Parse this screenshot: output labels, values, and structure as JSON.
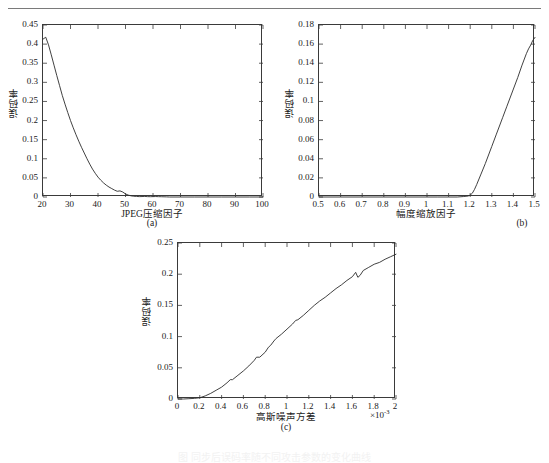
{
  "page": {
    "rule_color": "#7a7a7a",
    "line_color": "#2b2b2b",
    "axis_color": "#3a3a3a"
  },
  "figure": {
    "subcaption_a": "(a)",
    "subcaption_b": "(b)",
    "subcaption_c": "(c)",
    "ghost_caption": "图      同步后误码率随不同攻击参数的变化曲线"
  },
  "chart_data": [
    {
      "id": "a",
      "type": "line",
      "title": "",
      "subcaption": "(a)",
      "xlabel": "JPEG压缩因子",
      "ylabel": "误码率",
      "xlim": [
        20,
        100
      ],
      "ylim": [
        0,
        0.45
      ],
      "xticks": [
        20,
        30,
        40,
        50,
        60,
        70,
        80,
        90,
        100
      ],
      "xticklabels": [
        "20",
        "30",
        "40",
        "50",
        "60",
        "70",
        "80",
        "90",
        "100"
      ],
      "yticks": [
        0,
        0.05,
        0.1,
        0.15,
        0.2,
        0.25,
        0.3,
        0.35,
        0.4,
        0.45
      ],
      "yticklabels": [
        "0",
        "0.05",
        "0.1",
        "0.15",
        "0.2",
        "0.25",
        "0.3",
        "0.35",
        "0.4",
        "0.45"
      ],
      "grid": false,
      "legend": "none",
      "x": [
        20,
        21,
        22,
        23,
        24,
        25,
        26,
        27,
        28,
        29,
        30,
        31,
        32,
        33,
        34,
        35,
        36,
        37,
        38,
        39,
        40,
        41,
        42,
        43,
        44,
        45,
        46,
        47,
        48,
        49,
        50,
        51,
        52,
        53,
        54,
        55,
        56,
        57,
        58,
        59,
        60,
        61,
        62,
        63,
        64,
        65,
        66,
        70,
        75,
        80,
        85,
        90,
        95,
        100
      ],
      "y": [
        0.413,
        0.418,
        0.398,
        0.372,
        0.345,
        0.318,
        0.292,
        0.266,
        0.243,
        0.221,
        0.2,
        0.181,
        0.163,
        0.146,
        0.13,
        0.115,
        0.1,
        0.086,
        0.073,
        0.062,
        0.052,
        0.044,
        0.037,
        0.031,
        0.026,
        0.022,
        0.018,
        0.015,
        0.016,
        0.013,
        0.008,
        0.005,
        0.003,
        0.002,
        0.0015,
        0.001,
        0.0012,
        0.0015,
        0.001,
        0.0008,
        0.001,
        0.0012,
        0.0009,
        0.0007,
        0.0005,
        0.0003,
        0.0,
        0.0,
        0.0,
        0.0,
        0.0,
        0.0,
        0.0,
        0.0
      ]
    },
    {
      "id": "b",
      "type": "line",
      "title": "",
      "subcaption": "(b)",
      "xlabel": "幅度缩放因子",
      "ylabel": "误码率",
      "xlim": [
        0.5,
        1.5
      ],
      "ylim": [
        0,
        0.18
      ],
      "xticks": [
        0.5,
        0.6,
        0.7,
        0.8,
        0.9,
        1.0,
        1.1,
        1.2,
        1.3,
        1.4,
        1.5
      ],
      "xticklabels": [
        "0.5",
        "0.6",
        "0.7",
        "0.8",
        "0.9",
        "1",
        "1.1",
        "1.2",
        "1.3",
        "1.4",
        "1.5"
      ],
      "yticks": [
        0,
        0.02,
        0.04,
        0.06,
        0.08,
        0.1,
        0.12,
        0.14,
        0.16,
        0.18
      ],
      "yticklabels": [
        "0",
        "0.02",
        "0.04",
        "0.06",
        "0.08",
        "0.1",
        "0.12",
        "0.14",
        "0.16",
        "0.18"
      ],
      "grid": false,
      "legend": "none",
      "x": [
        0.5,
        0.6,
        0.7,
        0.8,
        0.9,
        1.0,
        1.05,
        1.1,
        1.14,
        1.17,
        1.19,
        1.2,
        1.21,
        1.22,
        1.23,
        1.25,
        1.27,
        1.3,
        1.32,
        1.35,
        1.37,
        1.4,
        1.42,
        1.44,
        1.46,
        1.47,
        1.48,
        1.49,
        1.5
      ],
      "y": [
        0.0,
        0.0,
        0.0,
        0.0,
        0.0,
        0.0,
        0.0,
        0.0,
        0.0,
        0.0005,
        0.001,
        0.002,
        0.004,
        0.008,
        0.013,
        0.024,
        0.035,
        0.053,
        0.065,
        0.083,
        0.095,
        0.113,
        0.125,
        0.138,
        0.15,
        0.155,
        0.159,
        0.164,
        0.167
      ]
    },
    {
      "id": "c",
      "type": "line",
      "title": "",
      "subcaption": "(c)",
      "xlabel": "高斯噪声方差",
      "ylabel": "误码率",
      "x_exponent": "×10",
      "x_exponent_power": "-3",
      "xlim": [
        0,
        2
      ],
      "ylim": [
        0,
        0.25
      ],
      "xticks": [
        0,
        0.2,
        0.4,
        0.6,
        0.8,
        1.0,
        1.2,
        1.4,
        1.6,
        1.8,
        2.0
      ],
      "xticklabels": [
        "0",
        "0.2",
        "0.4",
        "0.6",
        "0.8",
        "1",
        "1.2",
        "1.4",
        "1.6",
        "1.8",
        "2"
      ],
      "yticks": [
        0,
        0.05,
        0.1,
        0.15,
        0.2,
        0.25
      ],
      "yticklabels": [
        "0",
        "0.05",
        "0.1",
        "0.15",
        "0.2",
        "0.25"
      ],
      "grid": false,
      "legend": "none",
      "x": [
        0.0,
        0.05,
        0.1,
        0.15,
        0.2,
        0.25,
        0.3,
        0.35,
        0.4,
        0.45,
        0.48,
        0.5,
        0.55,
        0.6,
        0.65,
        0.7,
        0.72,
        0.75,
        0.8,
        0.83,
        0.85,
        0.88,
        0.9,
        0.95,
        1.0,
        1.05,
        1.08,
        1.1,
        1.15,
        1.2,
        1.25,
        1.3,
        1.35,
        1.4,
        1.45,
        1.5,
        1.55,
        1.6,
        1.63,
        1.65,
        1.67,
        1.7,
        1.75,
        1.8,
        1.85,
        1.9,
        1.95,
        2.0
      ],
      "y": [
        0.0,
        0.0,
        0.0005,
        0.001,
        0.002,
        0.005,
        0.009,
        0.014,
        0.019,
        0.026,
        0.031,
        0.031,
        0.038,
        0.045,
        0.053,
        0.062,
        0.067,
        0.067,
        0.075,
        0.083,
        0.086,
        0.093,
        0.097,
        0.104,
        0.112,
        0.12,
        0.126,
        0.127,
        0.134,
        0.142,
        0.15,
        0.157,
        0.163,
        0.17,
        0.177,
        0.183,
        0.19,
        0.196,
        0.203,
        0.195,
        0.198,
        0.206,
        0.211,
        0.216,
        0.219,
        0.224,
        0.228,
        0.232
      ]
    }
  ]
}
